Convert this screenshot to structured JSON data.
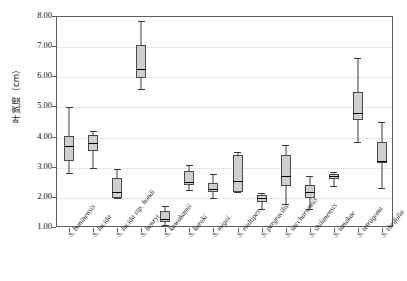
{
  "chart_data": {
    "type": "box",
    "title": "",
    "xlabel": "",
    "ylabel": "叶宽度（cm）",
    "ylim": [
      1.0,
      8.0
    ],
    "ytick_labels": [
      "1.00",
      "2.00",
      "3.00",
      "4.00",
      "5.00",
      "6.00",
      "7.00",
      "8.00"
    ],
    "ytick_values": [
      1.0,
      2.0,
      3.0,
      4.0,
      5.0,
      6.0,
      7.0,
      8.0
    ],
    "grid": true,
    "legend": "none",
    "units": "cm",
    "categories": [
      "S. boninensis",
      "S. lucida",
      "S. lucida ssp. hondi",
      "S. henryi",
      "S. kawakamii",
      "S. kuroki",
      "S. migoi",
      "S. multipes",
      "S. pergracilis",
      "S. sacchariensis",
      "S. shilanensis",
      "S. tanakae",
      "S. tetragona",
      "S. theifolia"
    ],
    "boxes": [
      {
        "name": "S. boninensis",
        "min": 2.82,
        "q1": 3.23,
        "median": 3.71,
        "q3": 4.04,
        "max": 5.0
      },
      {
        "name": "S. lucida",
        "min": 3.0,
        "q1": 3.55,
        "median": 3.82,
        "q3": 4.1,
        "max": 4.22
      },
      {
        "name": "S. lucida ssp. hondi",
        "min": 1.98,
        "q1": 2.0,
        "median": 2.2,
        "q3": 2.65,
        "max": 2.96
      },
      {
        "name": "S. henryi",
        "min": 5.6,
        "q1": 5.98,
        "median": 6.27,
        "q3": 7.06,
        "max": 7.86
      },
      {
        "name": "S. kawakamii",
        "min": 1.09,
        "q1": 1.19,
        "median": 1.31,
        "q3": 1.58,
        "max": 1.74
      },
      {
        "name": "S. kuroki",
        "min": 2.27,
        "q1": 2.43,
        "median": 2.53,
        "q3": 2.88,
        "max": 3.1
      },
      {
        "name": "S. migoi",
        "min": 1.98,
        "q1": 2.18,
        "median": 2.29,
        "q3": 2.48,
        "max": 2.79
      },
      {
        "name": "S. multipes",
        "min": 2.19,
        "q1": 2.21,
        "median": 2.57,
        "q3": 3.41,
        "max": 3.53
      },
      {
        "name": "S. pergracilis",
        "min": 1.64,
        "q1": 1.87,
        "median": 2.0,
        "q3": 2.1,
        "max": 2.17
      },
      {
        "name": "S. sacchariensis",
        "min": 1.81,
        "q1": 2.4,
        "median": 2.72,
        "q3": 3.41,
        "max": 3.76
      },
      {
        "name": "S. shilanensis",
        "min": 1.62,
        "q1": 2.01,
        "median": 2.19,
        "q3": 2.44,
        "max": 2.72
      },
      {
        "name": "S. tanakae",
        "min": 2.4,
        "q1": 2.63,
        "median": 2.71,
        "q3": 2.8,
        "max": 2.87
      },
      {
        "name": "S. tetragona",
        "min": 3.86,
        "q1": 4.59,
        "median": 4.8,
        "q3": 5.5,
        "max": 6.64
      },
      {
        "name": "S. theifolia",
        "min": 2.33,
        "q1": 3.14,
        "median": 3.21,
        "q3": 3.86,
        "max": 4.52
      }
    ],
    "colors": {
      "box_fill": "#cfcfcf",
      "box_edge": "#4a4a4a",
      "median": "#000000",
      "whisker": "#3a3a3a",
      "grid": "#d3d3d3",
      "frame": "#5d5d5d",
      "background": "#ffffff"
    }
  }
}
